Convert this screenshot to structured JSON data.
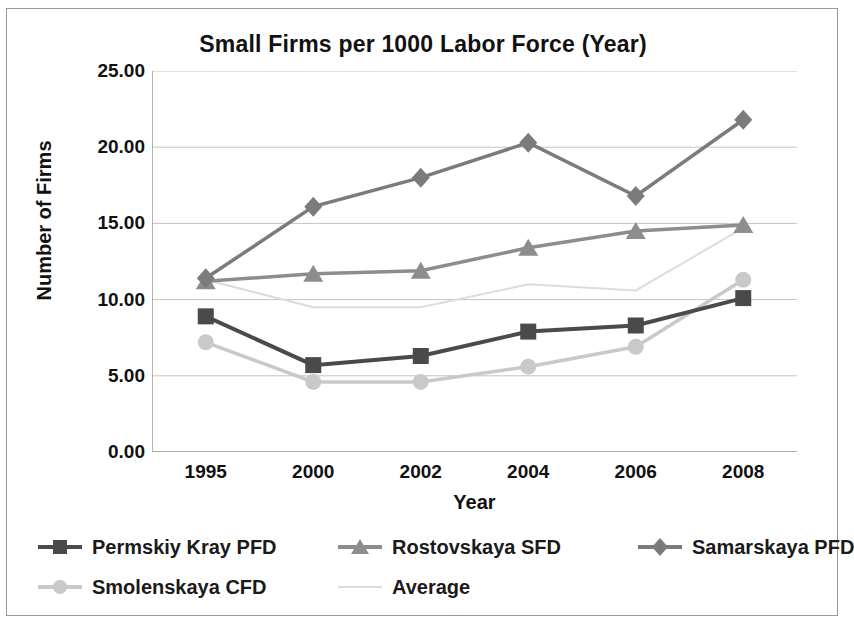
{
  "chart_data": {
    "type": "line",
    "title": "Small Firms per 1000 Labor Force (Year)",
    "xlabel": "Year",
    "ylabel": "Number of Firms",
    "categories": [
      "1995",
      "2000",
      "2002",
      "2004",
      "2006",
      "2008"
    ],
    "ylim": [
      0,
      25
    ],
    "yticks": [
      "0.00",
      "5.00",
      "10.00",
      "15.00",
      "20.00",
      "25.00"
    ],
    "ytick_values": [
      0,
      5,
      10,
      15,
      20,
      25
    ],
    "grid": true,
    "legend_position": "bottom",
    "series": [
      {
        "name": "Permskiy Kray PFD",
        "marker": "square",
        "color": "#4a4a4a",
        "values": [
          8.9,
          5.7,
          6.3,
          7.9,
          8.3,
          10.1
        ]
      },
      {
        "name": "Rostovskaya SFD",
        "marker": "triangle",
        "color": "#8d8d8d",
        "values": [
          11.2,
          11.7,
          11.9,
          13.4,
          14.5,
          14.9
        ]
      },
      {
        "name": "Samarskaya PFD",
        "marker": "diamond",
        "color": "#7b7b7b",
        "values": [
          11.4,
          16.1,
          18.0,
          20.3,
          16.8,
          21.8
        ]
      },
      {
        "name": "Smolenskaya CFD",
        "marker": "circle",
        "color": "#c9c9c9",
        "values": [
          7.2,
          4.6,
          4.6,
          5.6,
          6.9,
          11.3
        ]
      },
      {
        "name": "Average",
        "marker": "none",
        "color": "#dcdcdc",
        "values": [
          11.3,
          9.5,
          9.5,
          11.0,
          10.6,
          14.7
        ]
      }
    ]
  },
  "axis_color": "#9a9a9a",
  "grid_color": "#c4c4c4"
}
